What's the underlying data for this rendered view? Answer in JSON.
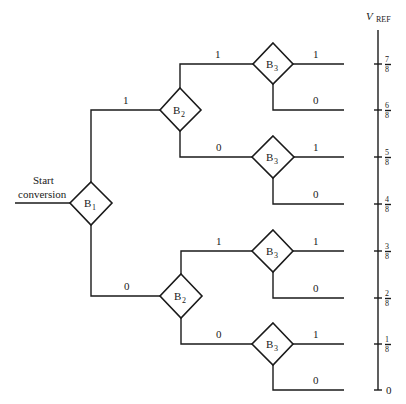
{
  "start_label": [
    "Start",
    "conversion"
  ],
  "axis": {
    "label": "V",
    "label_sub": "REF",
    "ticks": [
      {
        "num": "7",
        "den": "8"
      },
      {
        "num": "6",
        "den": "8"
      },
      {
        "num": "5",
        "den": "8"
      },
      {
        "num": "4",
        "den": "8"
      },
      {
        "num": "3",
        "den": "8"
      },
      {
        "num": "2",
        "den": "8"
      },
      {
        "num": "1",
        "den": "8"
      },
      {
        "num": "0",
        "den": ""
      }
    ]
  },
  "nodes": {
    "b1": {
      "letter": "B",
      "sub": "1"
    },
    "b2_upper": {
      "letter": "B",
      "sub": "2"
    },
    "b2_lower": {
      "letter": "B",
      "sub": "2"
    },
    "b3_1": {
      "letter": "B",
      "sub": "3"
    },
    "b3_2": {
      "letter": "B",
      "sub": "3"
    },
    "b3_3": {
      "letter": "B",
      "sub": "3"
    },
    "b3_4": {
      "letter": "B",
      "sub": "3"
    }
  },
  "edges": {
    "b1_up": "1",
    "b1_down": "0",
    "b2u_up": "1",
    "b2u_down": "0",
    "b2l_up": "1",
    "b2l_down": "0",
    "out": [
      "1",
      "0",
      "1",
      "0",
      "1",
      "0",
      "1",
      "0"
    ]
  }
}
